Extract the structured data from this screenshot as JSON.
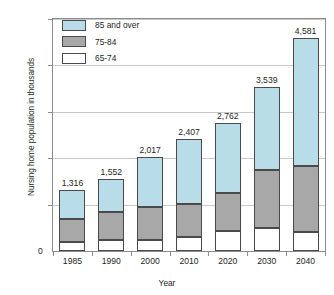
{
  "chart_data": {
    "type": "bar",
    "stacked": true,
    "title": "",
    "xlabel": "Year",
    "ylabel": "Nursing home population in thousands",
    "categories": [
      "1985",
      "1990",
      "2000",
      "2010",
      "2020",
      "2030",
      "2040"
    ],
    "series": [
      {
        "name": "65-74",
        "color": "#ffffff",
        "values": [
          190,
          230,
          240,
          300,
          430,
          500,
          410
        ]
      },
      {
        "name": "75-84",
        "color": "#a8a8a8",
        "values": [
          510,
          615,
          715,
          705,
          810,
          1240,
          1430
        ]
      },
      {
        "name": "85 and over",
        "color": "#b8dce8",
        "values": [
          616,
          707,
          1062,
          1402,
          1522,
          1799,
          2741
        ]
      }
    ],
    "totals": [
      1316,
      1552,
      2017,
      2407,
      2762,
      3539,
      4581
    ],
    "total_labels": [
      "1,316",
      "1,552",
      "2,017",
      "2,407",
      "2,762",
      "3,539",
      "4,581"
    ],
    "ylim": [
      0,
      5000
    ],
    "yticks": [
      0,
      1000,
      2000,
      3000,
      4000,
      5000
    ],
    "ytick_labels": [
      "0",
      "1,000",
      "2,000",
      "3,000",
      "4,000",
      "5,000"
    ],
    "grid": true,
    "legend_position": "top-left",
    "legend": [
      {
        "label": "85 and over",
        "color": "#b8dce8"
      },
      {
        "label": "75-84",
        "color": "#a8a8a8"
      },
      {
        "label": "65-74",
        "color": "#ffffff"
      }
    ]
  }
}
